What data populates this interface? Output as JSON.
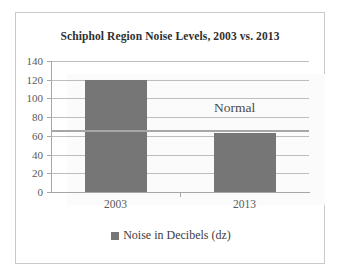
{
  "chart_data": {
    "type": "bar",
    "title": "Schiphol Region Noise Levels, 2003 vs. 2013",
    "categories": [
      "2003",
      "2013"
    ],
    "values": [
      120,
      63
    ],
    "series": [
      {
        "name": "Noise in Decibels (dz)",
        "values": [
          120,
          63
        ]
      }
    ],
    "xlabel": "",
    "ylabel": "",
    "ylim": [
      0,
      140
    ],
    "ytick_step": 20,
    "yticks": [
      "140",
      "120",
      "100",
      "80",
      "60",
      "40",
      "20",
      "0"
    ],
    "grid": true,
    "legend_position": "bottom",
    "legend": [
      "Noise in Decibels (dz)"
    ],
    "annotations": [
      {
        "label": "Normal",
        "value": 66,
        "type": "reference-line"
      }
    ],
    "colors": {
      "bar": "#767676",
      "gridline": "#bdbdbd",
      "axis": "#a6a6a6",
      "plot_background": "#fbfbfb",
      "frame_border": "#c9c9c9",
      "title_text": "#2f2f2f",
      "tick_text": "#595959",
      "annotation_text": "#494949"
    }
  }
}
